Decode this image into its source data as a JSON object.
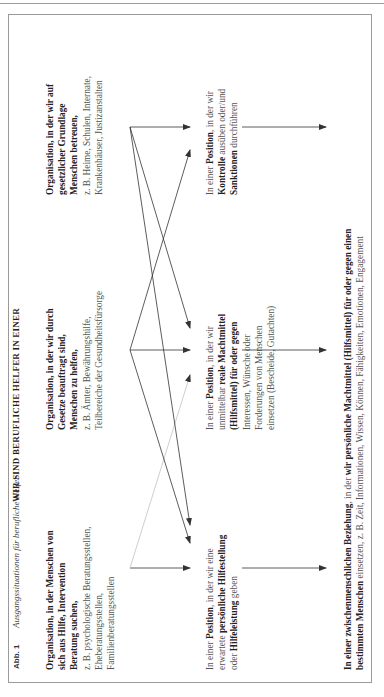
{
  "figure": {
    "label": "Abb. 1",
    "caption": "Ausgangssituationen für berufliche Helfer",
    "orientation": "rotated 90° counter-clockwise"
  },
  "heading": "WIR SIND BERUFLICHE HELFER IN EINER",
  "sources": [
    {
      "id": "A",
      "lines_bold": [
        "Organisation, in der Menschen von",
        "sich aus Hilfe, Intervention",
        "Beratung suchen,"
      ],
      "lines_regular": [
        "z. B. psychologische Beratungsstellen,",
        "Eheberatungsstellen,",
        "Familienberatungsstellen"
      ]
    },
    {
      "id": "B",
      "lines_bold": [
        "Organisation, in der wir durch",
        "Gesetze beauftragt sind,",
        "Menschen zu helfen,"
      ],
      "lines_regular": [
        "z. B. Ämter, Bewährungshilfe,",
        "Teilbereiche der Gesundheitsfürsorge"
      ]
    },
    {
      "id": "C",
      "lines_bold": [
        "Organisation, in der wir auf",
        "gesetzlicher Grundlage",
        "Menschen betreuen,"
      ],
      "lines_regular": [
        "z. B. Heime, Schulen, Internate,",
        "Krankenhäuser, Justizanstalten"
      ]
    }
  ],
  "positions": [
    {
      "id": "pos1",
      "lines": [
        [
          {
            "t": "In einer ",
            "b": false
          },
          {
            "t": "Position",
            "b": true
          },
          {
            "t": ", in der wir eine",
            "b": false
          }
        ],
        [
          {
            "t": "erwartete ",
            "b": false
          },
          {
            "t": "persönliche Hilfestellung",
            "b": true
          }
        ],
        [
          {
            "t": "oder ",
            "b": false
          },
          {
            "t": "Hilfeleistung",
            "b": true
          },
          {
            "t": " geben",
            "b": false
          }
        ]
      ]
    },
    {
      "id": "pos2",
      "lines": [
        [
          {
            "t": "In einer ",
            "b": false
          },
          {
            "t": "Position",
            "b": true
          },
          {
            "t": ", in der wir",
            "b": false
          }
        ],
        [
          {
            "t": "unmittelbar ",
            "b": false
          },
          {
            "t": "reale Machtmittel",
            "b": true
          }
        ],
        [
          {
            "t": "(Hilfsmittel) für oder gegen",
            "b": true
          }
        ],
        [
          {
            "t": "Interessen, Wünsche oder",
            "b": false
          }
        ],
        [
          {
            "t": "Forderungen von Menschen",
            "b": false
          }
        ],
        [
          {
            "t": "einsetzen (Bescheide, Gutachten)",
            "b": false
          }
        ]
      ]
    },
    {
      "id": "pos3",
      "lines": [
        [
          {
            "t": "In einer ",
            "b": false
          },
          {
            "t": "Position",
            "b": true
          },
          {
            "t": ", in der wir",
            "b": false
          }
        ],
        [
          {
            "t": "Kontrolle",
            "b": true
          },
          {
            "t": " ausüben oder/und",
            "b": false
          }
        ],
        [
          {
            "t": "Sanktionen",
            "b": true
          },
          {
            "t": " durchführen",
            "b": false
          }
        ]
      ]
    }
  ],
  "relationship": {
    "line1_bold": "In einer zwischenmenschlichen Beziehung",
    "line1_regular": ", in der ",
    "line1_bold2": "wir persönliche Machtmittel (Hilfsmittel) für oder gegen einen",
    "line2_bold": "bestimmten Menschen",
    "line2_regular": " einsetzen, z. B. Zeit, Informationen, Wissen, Können, Fähigkeiten, Emotionen, Engagement"
  },
  "arrows": [
    {
      "from": "A",
      "to": "pos1",
      "style": "straight"
    },
    {
      "from": "A",
      "to": "pos2",
      "style": "diagonal-light"
    },
    {
      "from": "B",
      "to": "pos1",
      "style": "diagonal"
    },
    {
      "from": "B",
      "to": "pos2",
      "style": "straight"
    },
    {
      "from": "B",
      "to": "pos3",
      "style": "diagonal"
    },
    {
      "from": "C",
      "to": "pos1",
      "style": "diagonal"
    },
    {
      "from": "C",
      "to": "pos2",
      "style": "diagonal"
    },
    {
      "from": "C",
      "to": "pos3",
      "style": "straight"
    },
    {
      "from": "pos1",
      "to": "relationship",
      "style": "straight"
    },
    {
      "from": "pos2",
      "to": "relationship",
      "style": "straight"
    },
    {
      "from": "pos3",
      "to": "relationship",
      "style": "straight"
    }
  ],
  "colors": {
    "frame": "#9a9a9a",
    "text_bold": "#222222",
    "text_regular": "#555555",
    "arrow": "#333333",
    "arrow_light": "#c8c8c8"
  }
}
